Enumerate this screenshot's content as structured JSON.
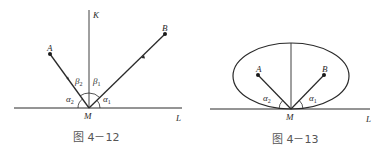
{
  "figures": [
    {
      "id": "fig-4-12",
      "caption": "图 4－12",
      "labels": {
        "K": "K",
        "A": "A",
        "B": "B",
        "M": "M",
        "L": "L",
        "alpha1": "α",
        "alpha1_sub": "1",
        "alpha2": "α",
        "alpha2_sub": "2",
        "beta1": "β",
        "beta1_sub": "1",
        "beta2": "β",
        "beta2_sub": "2"
      }
    },
    {
      "id": "fig-4-13",
      "caption": "图 4－13",
      "labels": {
        "A": "A",
        "B": "B",
        "M": "M",
        "L": "L",
        "alpha1": "α",
        "alpha1_sub": "1",
        "alpha2": "α",
        "alpha2_sub": "2"
      }
    }
  ],
  "colors": {
    "stroke": "#2a2a2a",
    "caption": "#555555",
    "background": "#ffffff"
  }
}
